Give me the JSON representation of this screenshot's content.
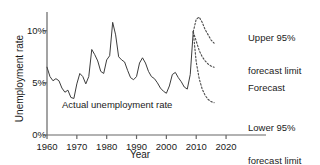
{
  "chart_data": {
    "type": "line",
    "title": "",
    "subtitle": "",
    "xlabel": "Year",
    "ylabel": "Unemployment rate",
    "xlim": [
      1960,
      2024
    ],
    "ylim": [
      0,
      11.6
    ],
    "grid": false,
    "legend_position": "none",
    "xticks": [
      1960,
      1970,
      1980,
      1990,
      2000,
      2010,
      2020
    ],
    "xticklabels": [
      "1960",
      "1970",
      "1980",
      "1990",
      "2000",
      "2010",
      "2020"
    ],
    "yticks": [
      0,
      5,
      10
    ],
    "yticklabels": [
      "0%",
      "5%",
      "10%"
    ],
    "annotations": [
      {
        "name": "upper-limit-annotation",
        "line1": "Upper 95%",
        "line2": "forecast limit"
      },
      {
        "name": "forecast-annotation",
        "line1": "Forecast",
        "line2": ""
      },
      {
        "name": "lower-limit-annotation",
        "line1": "Lower 95%",
        "line2": "forecast limit"
      },
      {
        "name": "actual-series-annotation",
        "line1": "Actual unemployment rate",
        "line2": ""
      }
    ],
    "series": [
      {
        "name": "Actual unemployment rate",
        "style": "solid",
        "color": "#3c3c3c",
        "x": [
          1960,
          1961,
          1962,
          1963,
          1964,
          1965,
          1966,
          1967,
          1968,
          1969,
          1970,
          1971,
          1972,
          1973,
          1974,
          1975,
          1976,
          1977,
          1978,
          1979,
          1980,
          1981,
          1982,
          1983,
          1984,
          1985,
          1986,
          1987,
          1988,
          1989,
          1990,
          1991,
          1992,
          1993,
          1994,
          1995,
          1996,
          1997,
          1998,
          1999,
          2000,
          2001,
          2002,
          2003,
          2004,
          2005,
          2006,
          2007,
          2008,
          2009
        ],
        "values": [
          6.5,
          5.6,
          5.2,
          5.4,
          5.2,
          4.5,
          4.1,
          4.3,
          3.6,
          3.5,
          4.9,
          5.9,
          5.6,
          4.9,
          5.6,
          8.2,
          7.7,
          7.1,
          6.1,
          5.9,
          7.2,
          7.6,
          10.8,
          9.6,
          7.5,
          7.2,
          7.0,
          6.2,
          5.5,
          5.3,
          5.6,
          6.9,
          7.4,
          6.9,
          6.1,
          5.6,
          5.4,
          5.0,
          4.5,
          4.2,
          4.0,
          4.7,
          5.8,
          6.0,
          5.5,
          5.1,
          4.6,
          4.4,
          5.8,
          9.9
        ]
      },
      {
        "name": "Upper 95% forecast limit",
        "style": "dashed",
        "color": "#4a4a4a",
        "x": [
          2009,
          2010,
          2011,
          2012,
          2013,
          2014,
          2015,
          2016
        ],
        "values": [
          9.9,
          11.1,
          11.3,
          10.8,
          10.1,
          9.6,
          9.1,
          8.8
        ]
      },
      {
        "name": "Forecast",
        "style": "dashed",
        "color": "#4a4a4a",
        "x": [
          2009,
          2010,
          2011,
          2012,
          2013,
          2014,
          2015,
          2016
        ],
        "values": [
          9.9,
          9.0,
          8.1,
          7.5,
          7.1,
          6.8,
          6.6,
          6.5
        ]
      },
      {
        "name": "Lower 95% forecast limit",
        "style": "dashed",
        "color": "#4a4a4a",
        "x": [
          2009,
          2010,
          2011,
          2012,
          2013,
          2014,
          2015,
          2016
        ],
        "values": [
          9.9,
          7.0,
          5.4,
          4.4,
          3.8,
          3.4,
          3.2,
          3.1
        ]
      }
    ]
  },
  "colors": {
    "axis": "#666666",
    "line": "#3c3c3c",
    "forecast": "#4a4a4a",
    "text": "#1a1a1a",
    "background": "#ffffff"
  }
}
